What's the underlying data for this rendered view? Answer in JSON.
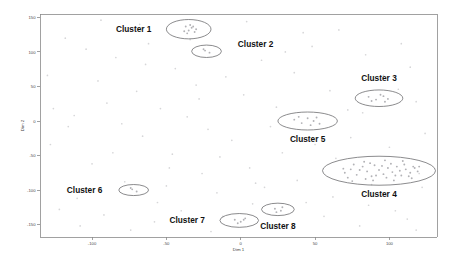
{
  "chart_data": {
    "type": "scatter",
    "title": "",
    "xlabel": "Dim 1",
    "ylabel": "Dim 2",
    "xlim": [
      -135,
      132
    ],
    "ylim": [
      -168,
      155
    ],
    "xticks": [
      -100,
      -50,
      0,
      50,
      100
    ],
    "xtick_labels": [
      "-100",
      "-50",
      "0",
      "50",
      "100"
    ],
    "yticks": [
      150,
      100,
      50,
      0,
      -50,
      -100,
      -150
    ],
    "ytick_labels": [
      "150",
      "100",
      "50",
      "0",
      "-50",
      "-100",
      "-150"
    ],
    "grid": false,
    "legend": "none",
    "point_color": "#d6d6d8",
    "cluster_point_color": "#b2b2b6",
    "ellipse_color": "#6d6d70",
    "label_color": "#111111",
    "clusters": [
      {
        "name": "Cluster 1",
        "center": [
          -35,
          133
        ],
        "rx": 15,
        "ry": 14,
        "label_position": "left",
        "label_x": -72,
        "label_y": 133,
        "n_points": 9,
        "points": [
          [
            -37,
            137
          ],
          [
            -33,
            135
          ],
          [
            -35,
            131
          ],
          [
            -31,
            129
          ],
          [
            -38,
            130
          ],
          [
            -34,
            139
          ],
          [
            -30,
            133
          ],
          [
            -36,
            127
          ],
          [
            -32,
            137
          ]
        ]
      },
      {
        "name": "Cluster 2",
        "center": [
          -23,
          101
        ],
        "rx": 10,
        "ry": 9,
        "label_position": "right",
        "label_x": 10,
        "label_y": 112,
        "n_points": 3,
        "points": [
          [
            -24,
            102
          ],
          [
            -21,
            99
          ],
          [
            -25,
            104
          ]
        ]
      },
      {
        "name": "Cluster 3",
        "center": [
          93,
          33
        ],
        "rx": 16,
        "ry": 12,
        "label_position": "above",
        "label_x": 93,
        "label_y": 62,
        "n_points": 7,
        "points": [
          [
            86,
            35
          ],
          [
            91,
            31
          ],
          [
            96,
            36
          ],
          [
            99,
            32
          ],
          [
            88,
            29
          ],
          [
            94,
            38
          ],
          [
            97,
            28
          ]
        ]
      },
      {
        "name": "Cluster 4",
        "center": [
          93,
          -72
        ],
        "rx": 38,
        "ry": 21,
        "label_position": "below",
        "label_x": 93,
        "label_y": -106,
        "n_points": 40,
        "points": [
          [
            70,
            -75
          ],
          [
            74,
            -70
          ],
          [
            78,
            -78
          ],
          [
            82,
            -66
          ],
          [
            85,
            -73
          ],
          [
            88,
            -80
          ],
          [
            90,
            -64
          ],
          [
            93,
            -71
          ],
          [
            96,
            -77
          ],
          [
            99,
            -68
          ],
          [
            102,
            -74
          ],
          [
            105,
            -66
          ],
          [
            108,
            -79
          ],
          [
            111,
            -70
          ],
          [
            114,
            -75
          ],
          [
            117,
            -68
          ],
          [
            72,
            -82
          ],
          [
            76,
            -63
          ],
          [
            80,
            -71
          ],
          [
            84,
            -84
          ],
          [
            87,
            -61
          ],
          [
            91,
            -79
          ],
          [
            95,
            -65
          ],
          [
            98,
            -82
          ],
          [
            101,
            -62
          ],
          [
            104,
            -79
          ],
          [
            107,
            -72
          ],
          [
            110,
            -63
          ],
          [
            113,
            -80
          ],
          [
            116,
            -66
          ],
          [
            69,
            -69
          ],
          [
            75,
            -87
          ],
          [
            83,
            -59
          ],
          [
            89,
            -86
          ],
          [
            97,
            -57
          ],
          [
            103,
            -86
          ],
          [
            109,
            -58
          ],
          [
            115,
            -83
          ],
          [
            119,
            -73
          ],
          [
            120,
            -66
          ]
        ]
      },
      {
        "name": "Cluster 5",
        "center": [
          45,
          0
        ],
        "rx": 20,
        "ry": 13,
        "label_position": "below",
        "label_x": 45,
        "label_y": -26,
        "n_points": 8,
        "points": [
          [
            36,
            2
          ],
          [
            41,
            -3
          ],
          [
            45,
            4
          ],
          [
            49,
            0
          ],
          [
            53,
            -4
          ],
          [
            39,
            6
          ],
          [
            47,
            -6
          ],
          [
            51,
            5
          ]
        ]
      },
      {
        "name": "Cluster 6",
        "center": [
          -72,
          -100
        ],
        "rx": 10,
        "ry": 8,
        "label_position": "left",
        "label_x": -105,
        "label_y": -100,
        "n_points": 3,
        "points": [
          [
            -73,
            -99
          ],
          [
            -70,
            -102
          ],
          [
            -74,
            -97
          ]
        ]
      },
      {
        "name": "Cluster 7",
        "center": [
          -1,
          -144
        ],
        "rx": 13,
        "ry": 10,
        "label_position": "left",
        "label_x": -36,
        "label_y": -144,
        "n_points": 5,
        "points": [
          [
            -4,
            -143
          ],
          [
            0,
            -146
          ],
          [
            3,
            -141
          ],
          [
            -2,
            -148
          ],
          [
            2,
            -143
          ]
        ]
      },
      {
        "name": "Cluster 8",
        "center": [
          25,
          -128
        ],
        "rx": 11,
        "ry": 9,
        "label_position": "below",
        "label_x": 25,
        "label_y": -152,
        "n_points": 4,
        "points": [
          [
            23,
            -127
          ],
          [
            27,
            -130
          ],
          [
            24,
            -132
          ],
          [
            28,
            -125
          ]
        ]
      }
    ],
    "background_points": [
      [
        -118,
        120
      ],
      [
        -96,
        58
      ],
      [
        -84,
        92
      ],
      [
        -70,
        43
      ],
      [
        -62,
        112
      ],
      [
        -54,
        18
      ],
      [
        -44,
        76
      ],
      [
        -30,
        52
      ],
      [
        -22,
        -12
      ],
      [
        -10,
        64
      ],
      [
        2,
        38
      ],
      [
        14,
        88
      ],
      [
        24,
        20
      ],
      [
        36,
        70
      ],
      [
        48,
        108
      ],
      [
        60,
        44
      ],
      [
        72,
        16
      ],
      [
        84,
        96
      ],
      [
        96,
        66
      ],
      [
        108,
        112
      ],
      [
        118,
        28
      ],
      [
        124,
        -18
      ],
      [
        -128,
        -34
      ],
      [
        -112,
        8
      ],
      [
        -100,
        -62
      ],
      [
        -90,
        26
      ],
      [
        -78,
        -88
      ],
      [
        -66,
        -22
      ],
      [
        -56,
        -118
      ],
      [
        -46,
        -48
      ],
      [
        -36,
        6
      ],
      [
        -26,
        -76
      ],
      [
        -16,
        -104
      ],
      [
        -6,
        -28
      ],
      [
        6,
        -68
      ],
      [
        16,
        -96
      ],
      [
        28,
        -46
      ],
      [
        38,
        -86
      ],
      [
        50,
        -34
      ],
      [
        62,
        -110
      ],
      [
        74,
        -24
      ],
      [
        86,
        -122
      ],
      [
        100,
        -38
      ],
      [
        112,
        -142
      ],
      [
        122,
        -96
      ],
      [
        -122,
        -128
      ],
      [
        -108,
        -152
      ],
      [
        -92,
        -136
      ],
      [
        -74,
        -158
      ],
      [
        -58,
        -146
      ],
      [
        -40,
        -130
      ],
      [
        -20,
        -160
      ],
      [
        8,
        -120
      ],
      [
        34,
        -156
      ],
      [
        56,
        -138
      ],
      [
        80,
        -152
      ],
      [
        104,
        -130
      ],
      [
        118,
        -158
      ],
      [
        -130,
        66
      ],
      [
        -116,
        -8
      ],
      [
        -104,
        104
      ],
      [
        -86,
        -46
      ],
      [
        -68,
        140
      ],
      [
        -50,
        -94
      ],
      [
        -34,
        118
      ],
      [
        -14,
        -52
      ],
      [
        4,
        144
      ],
      [
        20,
        -8
      ],
      [
        42,
        128
      ],
      [
        64,
        -54
      ],
      [
        82,
        12
      ],
      [
        98,
        -108
      ],
      [
        114,
        78
      ],
      [
        -126,
        18
      ],
      [
        -110,
        -112
      ],
      [
        -94,
        146
      ],
      [
        -80,
        -4
      ],
      [
        -64,
        82
      ],
      [
        -48,
        -68
      ],
      [
        -28,
        32
      ],
      [
        -12,
        -138
      ],
      [
        10,
        -90
      ],
      [
        30,
        100
      ],
      [
        44,
        -118
      ],
      [
        66,
        132
      ],
      [
        88,
        -92
      ],
      [
        106,
        46
      ],
      [
        120,
        -76
      ]
    ]
  }
}
